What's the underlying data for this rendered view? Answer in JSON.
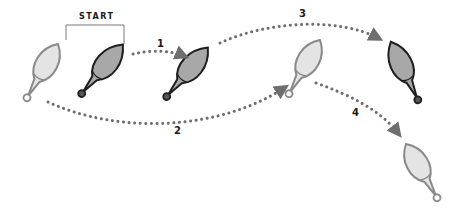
{
  "diagram": {
    "title": "START",
    "steps": [
      {
        "label": "1"
      },
      {
        "label": "2"
      },
      {
        "label": "3"
      },
      {
        "label": "4"
      }
    ],
    "colors": {
      "dark_fill": "#a8a8a8",
      "dark_stroke": "#1f1f1f",
      "light_fill": "#e4e4e4",
      "light_stroke": "#8a8a8a",
      "arrow": "#6e6e6e",
      "bracket": "#7a7a7a"
    }
  }
}
